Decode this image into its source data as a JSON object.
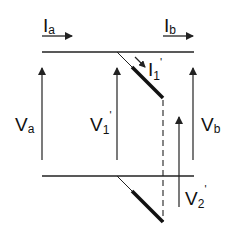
{
  "diagram": {
    "labels": {
      "Ia": {
        "main": "I",
        "sub": "a",
        "prime": ""
      },
      "Ib": {
        "main": "I",
        "sub": "b",
        "prime": ""
      },
      "I1p": {
        "main": "I",
        "sub": "1",
        "prime": "'"
      },
      "Va": {
        "main": "V",
        "sub": "a",
        "prime": ""
      },
      "V1p": {
        "main": "V",
        "sub": "1",
        "prime": "'"
      },
      "Vb": {
        "main": "V",
        "sub": "b",
        "prime": ""
      },
      "V2p": {
        "main": "V",
        "sub": "2",
        "prime": "'"
      }
    },
    "colors": {
      "line": "#222222",
      "background": "#ffffff"
    }
  }
}
